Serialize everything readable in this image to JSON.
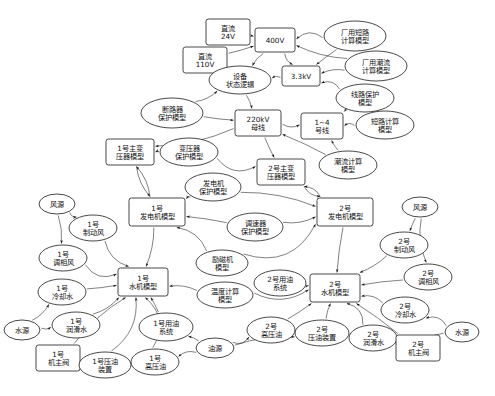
{
  "diagram": {
    "title_visible_fragment": "",
    "kind": "directed-graph",
    "shape_legend": {
      "rectangle": "系统/设备对象",
      "ellipse": "计算与保护模型"
    },
    "nodes": [
      {
        "id": "dc24",
        "label": "直流\n24V",
        "shape": "rect",
        "x": 228,
        "y": 32,
        "w": 44,
        "h": 26
      },
      {
        "id": "dc110",
        "label": "直流\n110V",
        "shape": "rect",
        "x": 205,
        "y": 60,
        "w": 44,
        "h": 26
      },
      {
        "id": "v400",
        "label": "400V",
        "shape": "rect",
        "x": 275,
        "y": 40,
        "w": 40,
        "h": 24
      },
      {
        "id": "kv33",
        "label": "3.3kV",
        "shape": "rect",
        "x": 301,
        "y": 76,
        "w": 38,
        "h": 20
      },
      {
        "id": "devlogic",
        "label": "设备\n状态逻辑",
        "shape": "ell",
        "x": 240,
        "y": 80,
        "w": 62,
        "h": 28
      },
      {
        "id": "fy_short",
        "label": "厂用短路\n计算模型",
        "shape": "ell",
        "x": 355,
        "y": 36,
        "w": 62,
        "h": 30
      },
      {
        "id": "fy_flow",
        "label": "厂用潮流\n计算模型",
        "shape": "ell",
        "x": 376,
        "y": 66,
        "w": 62,
        "h": 30
      },
      {
        "id": "line_prot",
        "label": "线路保护\n模型",
        "shape": "ell",
        "x": 365,
        "y": 98,
        "w": 58,
        "h": 28
      },
      {
        "id": "brk_prot",
        "label": "断路器\n保护模型",
        "shape": "ell",
        "x": 172,
        "y": 113,
        "w": 62,
        "h": 30
      },
      {
        "id": "bus220",
        "label": "220kV\n母线",
        "shape": "rect",
        "x": 258,
        "y": 123,
        "w": 46,
        "h": 26
      },
      {
        "id": "line14",
        "label": "1~4\n号线",
        "shape": "rect",
        "x": 322,
        "y": 126,
        "w": 42,
        "h": 26
      },
      {
        "id": "short_cal",
        "label": "短路计算\n模型",
        "shape": "ell",
        "x": 385,
        "y": 125,
        "w": 58,
        "h": 28
      },
      {
        "id": "flow_cal",
        "label": "潮流计算\n模型",
        "shape": "ell",
        "x": 348,
        "y": 165,
        "w": 58,
        "h": 28
      },
      {
        "id": "tr_prot",
        "label": "变压器\n保护模型",
        "shape": "ell",
        "x": 189,
        "y": 152,
        "w": 58,
        "h": 28
      },
      {
        "id": "mtr1",
        "label": "1号主变\n压器模型",
        "shape": "rect",
        "x": 130,
        "y": 152,
        "w": 48,
        "h": 26
      },
      {
        "id": "mtr2",
        "label": "2号主变\n压器模型",
        "shape": "rect",
        "x": 281,
        "y": 172,
        "w": 48,
        "h": 26
      },
      {
        "id": "gen_prot",
        "label": "发电机\n保护模型",
        "shape": "ell",
        "x": 213,
        "y": 187,
        "w": 56,
        "h": 28
      },
      {
        "id": "gen1",
        "label": "1号\n发电机模型",
        "shape": "rect",
        "x": 157,
        "y": 212,
        "w": 56,
        "h": 28
      },
      {
        "id": "gen2",
        "label": "2号\n发电机模型",
        "shape": "rect",
        "x": 345,
        "y": 212,
        "w": 56,
        "h": 28
      },
      {
        "id": "gov_prot",
        "label": "调速器\n保护模型",
        "shape": "ell",
        "x": 255,
        "y": 227,
        "w": 56,
        "h": 28
      },
      {
        "id": "exc_model",
        "label": "励磁机\n模型",
        "shape": "ell",
        "x": 222,
        "y": 263,
        "w": 52,
        "h": 26
      },
      {
        "id": "temp_cal",
        "label": "温度计算\n模型",
        "shape": "ell",
        "x": 225,
        "y": 295,
        "w": 56,
        "h": 26
      },
      {
        "id": "hyd1",
        "label": "1号\n水机模型",
        "shape": "rect",
        "x": 143,
        "y": 282,
        "w": 50,
        "h": 28
      },
      {
        "id": "hyd2",
        "label": "2号\n水机模型",
        "shape": "rect",
        "x": 335,
        "y": 288,
        "w": 50,
        "h": 28
      },
      {
        "id": "wind_src1",
        "label": "风源",
        "shape": "ell",
        "x": 57,
        "y": 204,
        "w": 36,
        "h": 20
      },
      {
        "id": "wind_src2",
        "label": "风源",
        "shape": "ell",
        "x": 420,
        "y": 207,
        "w": 36,
        "h": 20
      },
      {
        "id": "brake1",
        "label": "1号\n制动风",
        "shape": "ell",
        "x": 93,
        "y": 228,
        "w": 48,
        "h": 26
      },
      {
        "id": "brake2",
        "label": "2号\n制动风",
        "shape": "ell",
        "x": 404,
        "y": 245,
        "w": 48,
        "h": 26
      },
      {
        "id": "phase1",
        "label": "1号\n调相风",
        "shape": "ell",
        "x": 63,
        "y": 258,
        "w": 48,
        "h": 26
      },
      {
        "id": "phase2",
        "label": "2号\n调相风",
        "shape": "ell",
        "x": 428,
        "y": 277,
        "w": 48,
        "h": 26
      },
      {
        "id": "cool1",
        "label": "1号\n冷却水",
        "shape": "ell",
        "x": 62,
        "y": 292,
        "w": 48,
        "h": 26
      },
      {
        "id": "cool2",
        "label": "2号\n冷却水",
        "shape": "ell",
        "x": 405,
        "y": 310,
        "w": 48,
        "h": 26
      },
      {
        "id": "lub1",
        "label": "1号\n润滑水",
        "shape": "ell",
        "x": 76,
        "y": 325,
        "w": 48,
        "h": 26
      },
      {
        "id": "lub2",
        "label": "2号\n润滑水",
        "shape": "ell",
        "x": 373,
        "y": 338,
        "w": 48,
        "h": 26
      },
      {
        "id": "wsrc1",
        "label": "水源",
        "shape": "ell",
        "x": 22,
        "y": 330,
        "w": 36,
        "h": 20
      },
      {
        "id": "wsrc2",
        "label": "水源",
        "shape": "ell",
        "x": 462,
        "y": 332,
        "w": 34,
        "h": 20
      },
      {
        "id": "mvalve1",
        "label": "1号\n机主阀",
        "shape": "rect",
        "x": 58,
        "y": 358,
        "w": 44,
        "h": 26
      },
      {
        "id": "mvalve2",
        "label": "2号\n机主阀",
        "shape": "rect",
        "x": 418,
        "y": 348,
        "w": 44,
        "h": 26
      },
      {
        "id": "oilsys1",
        "label": "1号用油\n系统",
        "shape": "ell",
        "x": 166,
        "y": 327,
        "w": 54,
        "h": 28
      },
      {
        "id": "oilsys2",
        "label": "2号用油\n系统",
        "shape": "ell",
        "x": 280,
        "y": 283,
        "w": 52,
        "h": 26
      },
      {
        "id": "oil_src",
        "label": "油源",
        "shape": "ell",
        "x": 215,
        "y": 348,
        "w": 38,
        "h": 20
      },
      {
        "id": "press1",
        "label": "1号压油\n装置",
        "shape": "ell",
        "x": 105,
        "y": 365,
        "w": 52,
        "h": 26
      },
      {
        "id": "press2",
        "label": "2号\n压油装置",
        "shape": "ell",
        "x": 322,
        "y": 333,
        "w": 54,
        "h": 26
      },
      {
        "id": "hpoil1",
        "label": "1号\n高压油",
        "shape": "ell",
        "x": 155,
        "y": 362,
        "w": 48,
        "h": 26
      },
      {
        "id": "hpoil2",
        "label": "2号\n高压油",
        "shape": "ell",
        "x": 271,
        "y": 330,
        "w": 48,
        "h": 26
      }
    ],
    "edges": [
      {
        "from": "dc24",
        "to": "v400"
      },
      {
        "from": "dc110",
        "to": "v400"
      },
      {
        "from": "v400",
        "to": "devlogic"
      },
      {
        "from": "v400",
        "to": "kv33"
      },
      {
        "from": "fy_short",
        "to": "v400"
      },
      {
        "from": "fy_flow",
        "to": "v400"
      },
      {
        "from": "fy_short",
        "to": "kv33"
      },
      {
        "from": "fy_flow",
        "to": "kv33"
      },
      {
        "from": "kv33",
        "to": "devlogic"
      },
      {
        "from": "line_prot",
        "to": "kv33"
      },
      {
        "from": "devlogic",
        "to": "bus220"
      },
      {
        "from": "brk_prot",
        "to": "bus220"
      },
      {
        "from": "brk_prot",
        "to": "devlogic"
      },
      {
        "from": "bus220",
        "to": "line14"
      },
      {
        "from": "short_cal",
        "to": "line14"
      },
      {
        "from": "flow_cal",
        "to": "line14"
      },
      {
        "from": "flow_cal",
        "to": "bus220"
      },
      {
        "from": "line_prot",
        "to": "line14"
      },
      {
        "from": "tr_prot",
        "to": "mtr1"
      },
      {
        "from": "tr_prot",
        "to": "mtr2"
      },
      {
        "from": "bus220",
        "to": "mtr1"
      },
      {
        "from": "bus220",
        "to": "mtr2"
      },
      {
        "from": "mtr1",
        "to": "gen1"
      },
      {
        "from": "mtr2",
        "to": "gen2"
      },
      {
        "from": "gen_prot",
        "to": "gen1"
      },
      {
        "from": "gen_prot",
        "to": "gen2"
      },
      {
        "from": "gov_prot",
        "to": "gen1"
      },
      {
        "from": "gov_prot",
        "to": "gen2"
      },
      {
        "from": "exc_model",
        "to": "gen1"
      },
      {
        "from": "exc_model",
        "to": "gen2"
      },
      {
        "from": "gen1",
        "to": "hyd1"
      },
      {
        "from": "gen2",
        "to": "hyd2"
      },
      {
        "from": "temp_cal",
        "to": "hyd1"
      },
      {
        "from": "temp_cal",
        "to": "hyd2"
      },
      {
        "from": "wind_src1",
        "to": "brake1"
      },
      {
        "from": "wind_src1",
        "to": "phase1"
      },
      {
        "from": "wind_src2",
        "to": "brake2"
      },
      {
        "from": "wind_src2",
        "to": "phase2"
      },
      {
        "from": "brake1",
        "to": "hyd1"
      },
      {
        "from": "phase1",
        "to": "hyd1"
      },
      {
        "from": "brake2",
        "to": "hyd2"
      },
      {
        "from": "phase2",
        "to": "hyd2"
      },
      {
        "from": "wsrc1",
        "to": "cool1"
      },
      {
        "from": "wsrc1",
        "to": "lub1"
      },
      {
        "from": "wsrc2",
        "to": "cool2"
      },
      {
        "from": "wsrc2",
        "to": "lub2"
      },
      {
        "from": "cool1",
        "to": "hyd1"
      },
      {
        "from": "lub1",
        "to": "hyd1"
      },
      {
        "from": "cool2",
        "to": "hyd2"
      },
      {
        "from": "lub2",
        "to": "hyd2"
      },
      {
        "from": "mvalve1",
        "to": "hyd1"
      },
      {
        "from": "mvalve2",
        "to": "hyd2"
      },
      {
        "from": "oil_src",
        "to": "oilsys1"
      },
      {
        "from": "oil_src",
        "to": "hpoil1"
      },
      {
        "from": "oil_src",
        "to": "hpoil2"
      },
      {
        "from": "oil_src",
        "to": "press2"
      },
      {
        "from": "oilsys1",
        "to": "hyd1"
      },
      {
        "from": "oilsys2",
        "to": "hyd2"
      },
      {
        "from": "press1",
        "to": "hyd1"
      },
      {
        "from": "hpoil1",
        "to": "hyd1"
      },
      {
        "from": "press2",
        "to": "hyd2"
      },
      {
        "from": "hpoil2",
        "to": "hyd2"
      },
      {
        "from": "gen1",
        "to": "mtr1"
      },
      {
        "from": "gen2",
        "to": "mtr2"
      }
    ]
  }
}
